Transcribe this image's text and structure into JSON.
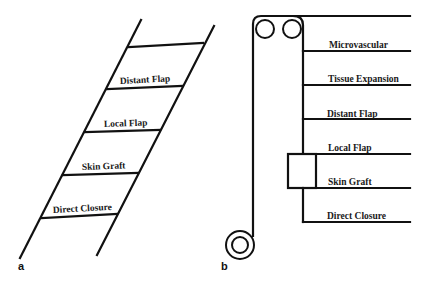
{
  "panels": [
    {
      "id": "a",
      "label": "a",
      "type": "reconstructive-ladder",
      "rungs": [
        "Distant Flap",
        "Local Flap",
        "Skin Graft",
        "Direct Closure"
      ]
    },
    {
      "id": "b",
      "label": "b",
      "type": "reconstructive-elevator",
      "floors": [
        "Microvascular",
        "Tissue Expansion",
        "Distant Flap",
        "Local Flap",
        "Skin Graft",
        "Direct Closure"
      ]
    }
  ]
}
